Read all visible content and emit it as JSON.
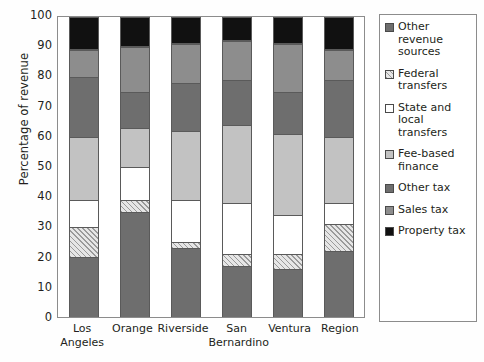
{
  "chart_data": {
    "type": "bar",
    "stacked": true,
    "title": "",
    "xlabel": "",
    "ylabel": "Percentage of revenue",
    "ylim": [
      0,
      100
    ],
    "yticks": [
      0,
      10,
      20,
      30,
      40,
      50,
      60,
      70,
      80,
      90,
      100
    ],
    "grid": false,
    "legend_position": "right",
    "categories": [
      "Los Angeles",
      "Orange",
      "Riverside",
      "San Bernardino",
      "Ventura",
      "Region"
    ],
    "series": [
      {
        "name": "Property tax",
        "swatch": "property-tax",
        "color": "#111111",
        "values": [
          11,
          10,
          9,
          8,
          9,
          11
        ]
      },
      {
        "name": "Sales tax",
        "swatch": "sales-tax",
        "color": "#8d8d8d",
        "values": [
          9,
          15,
          13,
          13,
          16,
          10
        ]
      },
      {
        "name": "Other tax",
        "swatch": "other-tax",
        "color": "#6e6e6e",
        "values": [
          20,
          12,
          16,
          15,
          14,
          19
        ]
      },
      {
        "name": "Fee-based finance",
        "swatch": "fee-based-finance",
        "color": "#c2c2c2",
        "values": [
          21,
          13,
          23,
          26,
          27,
          22
        ]
      },
      {
        "name": "State and local transfers",
        "swatch": "state-and-local-transfers",
        "color": "#ffffff",
        "values": [
          9,
          11,
          14,
          17,
          13,
          7
        ]
      },
      {
        "name": "Federal transfers",
        "swatch": "federal-transfers",
        "color": "#d9d9d9",
        "pattern": "diagonal-hatch",
        "values": [
          10,
          4,
          2,
          4,
          5,
          9
        ]
      },
      {
        "name": "Other revenue sources",
        "swatch": "other-revenue-sources",
        "color": "#6e6e6e",
        "values": [
          20,
          35,
          23,
          17,
          16,
          22
        ]
      }
    ],
    "stack_order_bottom_to_top": [
      "Property tax",
      "Sales tax",
      "Other tax",
      "Fee-based finance",
      "State and local transfers",
      "Federal transfers",
      "Other revenue sources"
    ]
  },
  "legend": {
    "items": [
      {
        "label": "Other revenue sources",
        "fill_class": "f-other-rev"
      },
      {
        "label": "Federal transfers",
        "fill_class": "f-federal"
      },
      {
        "label": "State and local transfers",
        "fill_class": "f-state-local"
      },
      {
        "label": "Fee-based finance",
        "fill_class": "f-fee"
      },
      {
        "label": "Other tax",
        "fill_class": "f-other-tax"
      },
      {
        "label": "Sales tax",
        "fill_class": "f-sales"
      },
      {
        "label": "Property tax",
        "fill_class": "f-property"
      }
    ]
  },
  "axis": {
    "y_title": "Percentage of revenue",
    "y_tick_labels": [
      "100",
      "90",
      "80",
      "70",
      "60",
      "50",
      "40",
      "30",
      "20",
      "10",
      "0"
    ],
    "x_tick_labels": [
      [
        "Los",
        "Angeles"
      ],
      [
        "Orange"
      ],
      [
        "Riverside"
      ],
      [
        "San",
        "Bernardino"
      ],
      [
        "Ventura"
      ],
      [
        "Region"
      ]
    ]
  }
}
